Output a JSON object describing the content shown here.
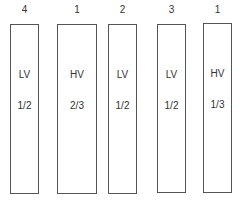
{
  "columns": [
    {
      "number": "4",
      "type": "LV",
      "fraction": "1/2"
    },
    {
      "number": "1",
      "type": "HV",
      "fraction": "2/3"
    },
    {
      "number": "2",
      "type": "LV",
      "fraction": "1/2"
    },
    {
      "number": "3",
      "type": "LV",
      "fraction": "1/2"
    },
    {
      "number": "1",
      "type": "HV",
      "fraction": "1/3"
    }
  ]
}
